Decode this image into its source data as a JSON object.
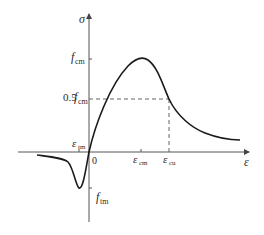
{
  "diagram": {
    "type": "stress-strain curve (concrete, tension and compression)",
    "axes": {
      "y_label": "σ",
      "x_label": "ε",
      "origin_label": "0"
    },
    "y_ticks": [
      {
        "main": "f",
        "sub": "cm",
        "prefix": ""
      },
      {
        "main": "f",
        "sub": "cm",
        "prefix": "0.5"
      },
      {
        "main": "f",
        "sub": "tm",
        "prefix": ""
      }
    ],
    "x_ticks": [
      {
        "main": "ε",
        "sub": "tm"
      },
      {
        "main": "ε",
        "sub": "cm"
      },
      {
        "main": "ε",
        "sub": "cu"
      }
    ],
    "colors": {
      "curve": "#1a1a1a",
      "axes": "#555555",
      "dashed": "#555555",
      "background": "#ffffff"
    }
  }
}
